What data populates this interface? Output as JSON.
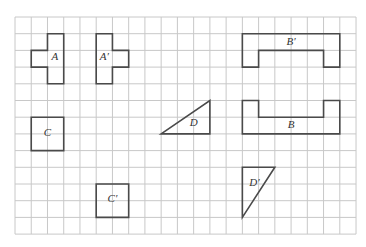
{
  "diagram": {
    "type": "grid-transformations",
    "grid": {
      "columns": 21,
      "rows": 13,
      "origin_px": [
        15,
        17
      ],
      "cell_w": 16.24,
      "cell_h": 16.7,
      "line_color": "#c8c8c8"
    },
    "shape_color": "#4a4a4a",
    "shapes": [
      {
        "id": "A",
        "label": "A",
        "points": [
          [
            2,
            1
          ],
          [
            3,
            1
          ],
          [
            3,
            4
          ],
          [
            2,
            4
          ],
          [
            2,
            3
          ],
          [
            1,
            3
          ],
          [
            1,
            2
          ],
          [
            2,
            2
          ]
        ],
        "label_pos": [
          2.45,
          2.6
        ]
      },
      {
        "id": "A-prime",
        "label": "A′",
        "points": [
          [
            5,
            1
          ],
          [
            6,
            1
          ],
          [
            6,
            2
          ],
          [
            7,
            2
          ],
          [
            7,
            3
          ],
          [
            6,
            3
          ],
          [
            6,
            4
          ],
          [
            5,
            4
          ]
        ],
        "label_pos": [
          5.5,
          2.6
        ]
      },
      {
        "id": "B-prime",
        "label": "B′",
        "points": [
          [
            14,
            1
          ],
          [
            20,
            1
          ],
          [
            20,
            3
          ],
          [
            19,
            3
          ],
          [
            19,
            2
          ],
          [
            15,
            2
          ],
          [
            15,
            3
          ],
          [
            14,
            3
          ]
        ],
        "label_pos": [
          17.0,
          1.65
        ]
      },
      {
        "id": "B",
        "label": "B",
        "points": [
          [
            14,
            5
          ],
          [
            15,
            5
          ],
          [
            15,
            6
          ],
          [
            19,
            6
          ],
          [
            19,
            5
          ],
          [
            20,
            5
          ],
          [
            20,
            7
          ],
          [
            14,
            7
          ]
        ],
        "label_pos": [
          17.0,
          6.65
        ]
      },
      {
        "id": "C",
        "label": "C",
        "points": [
          [
            1,
            6
          ],
          [
            3,
            6
          ],
          [
            3,
            8
          ],
          [
            1,
            8
          ]
        ],
        "label_pos": [
          2.0,
          7.1
        ]
      },
      {
        "id": "C-prime",
        "label": "C′",
        "points": [
          [
            5,
            10
          ],
          [
            7,
            10
          ],
          [
            7,
            12
          ],
          [
            5,
            12
          ]
        ],
        "label_pos": [
          6.0,
          11.1
        ]
      },
      {
        "id": "D",
        "label": "D",
        "points": [
          [
            9,
            7
          ],
          [
            12,
            5
          ],
          [
            12,
            7
          ]
        ],
        "label_pos": [
          11.0,
          6.55
        ]
      },
      {
        "id": "D-prime",
        "label": "D′",
        "points": [
          [
            14,
            9
          ],
          [
            16,
            9
          ],
          [
            14,
            12
          ]
        ],
        "label_pos": [
          14.75,
          10.1
        ]
      }
    ]
  }
}
